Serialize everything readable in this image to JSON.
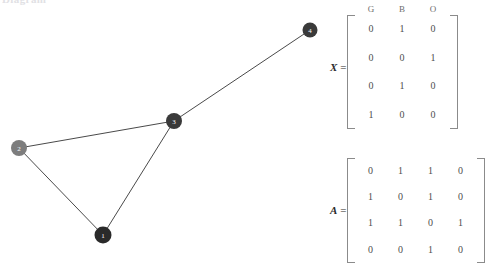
{
  "clipped_heading": "Diagram",
  "graph": {
    "nodes": [
      {
        "id": "1",
        "label": "1",
        "cx": 103,
        "cy": 235,
        "r": 8.5,
        "color": "#2a2a2a"
      },
      {
        "id": "2",
        "label": "2",
        "cx": 19,
        "cy": 148,
        "r": 8.0,
        "color": "#7d7d7d"
      },
      {
        "id": "3",
        "label": "3",
        "cx": 174,
        "cy": 121,
        "r": 8.0,
        "color": "#3a3a3a"
      },
      {
        "id": "4",
        "label": "4",
        "cx": 310,
        "cy": 30,
        "r": 7.5,
        "color": "#3a3a3a"
      }
    ],
    "edges": [
      {
        "from": "2",
        "to": "3"
      },
      {
        "from": "2",
        "to": "1"
      },
      {
        "from": "1",
        "to": "3"
      },
      {
        "from": "3",
        "to": "4"
      }
    ],
    "edge_color": "#4a4a4a"
  },
  "matrices": [
    {
      "key": "X",
      "name": "X",
      "equals": "=",
      "column_headers": [
        "G",
        "B",
        "O"
      ],
      "rows": [
        [
          "0",
          "1",
          "0"
        ],
        [
          "0",
          "0",
          "1"
        ],
        [
          "0",
          "1",
          "0"
        ],
        [
          "1",
          "0",
          "0"
        ]
      ]
    },
    {
      "key": "A",
      "name": "A",
      "equals": "=",
      "column_headers": [],
      "rows": [
        [
          "0",
          "1",
          "1",
          "0"
        ],
        [
          "1",
          "0",
          "1",
          "0"
        ],
        [
          "1",
          "1",
          "0",
          "1"
        ],
        [
          "0",
          "0",
          "1",
          "0"
        ]
      ]
    }
  ]
}
